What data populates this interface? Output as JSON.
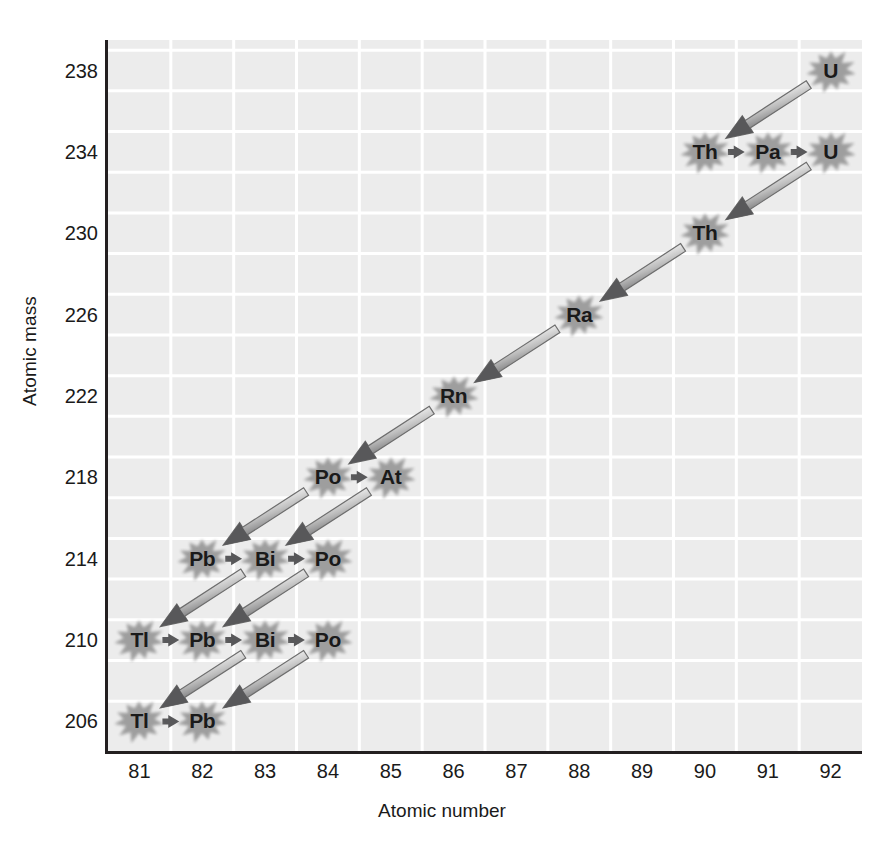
{
  "chart_data": {
    "type": "scatter",
    "title": "",
    "xlabel": "Atomic number",
    "ylabel": "Atomic mass",
    "xlim": [
      80.5,
      92.5
    ],
    "ylim": [
      204.5,
      239.5
    ],
    "xticks": [
      81,
      82,
      83,
      84,
      85,
      86,
      87,
      88,
      89,
      90,
      91,
      92
    ],
    "yticks": [
      238,
      234,
      230,
      226,
      222,
      218,
      214,
      210,
      206
    ],
    "grid": true,
    "legend": "none",
    "nodes": [
      {
        "symbol": "U",
        "atomic_number": 92,
        "atomic_mass": 238
      },
      {
        "symbol": "Th",
        "atomic_number": 90,
        "atomic_mass": 234
      },
      {
        "symbol": "Pa",
        "atomic_number": 91,
        "atomic_mass": 234
      },
      {
        "symbol": "U",
        "atomic_number": 92,
        "atomic_mass": 234
      },
      {
        "symbol": "Th",
        "atomic_number": 90,
        "atomic_mass": 230
      },
      {
        "symbol": "Ra",
        "atomic_number": 88,
        "atomic_mass": 226
      },
      {
        "symbol": "Rn",
        "atomic_number": 86,
        "atomic_mass": 222
      },
      {
        "symbol": "Po",
        "atomic_number": 84,
        "atomic_mass": 218
      },
      {
        "symbol": "At",
        "atomic_number": 85,
        "atomic_mass": 218
      },
      {
        "symbol": "Pb",
        "atomic_number": 82,
        "atomic_mass": 214
      },
      {
        "symbol": "Bi",
        "atomic_number": 83,
        "atomic_mass": 214
      },
      {
        "symbol": "Po",
        "atomic_number": 84,
        "atomic_mass": 214
      },
      {
        "symbol": "Tl",
        "atomic_number": 81,
        "atomic_mass": 210
      },
      {
        "symbol": "Pb",
        "atomic_number": 82,
        "atomic_mass": 210
      },
      {
        "symbol": "Bi",
        "atomic_number": 83,
        "atomic_mass": 210
      },
      {
        "symbol": "Po",
        "atomic_number": 84,
        "atomic_mass": 210
      },
      {
        "symbol": "Tl",
        "atomic_number": 81,
        "atomic_mass": 206
      },
      {
        "symbol": "Pb",
        "atomic_number": 82,
        "atomic_mass": 206
      }
    ],
    "transitions": [
      {
        "type": "alpha",
        "from": [
          92,
          238
        ],
        "to": [
          90,
          234
        ]
      },
      {
        "type": "beta",
        "from": [
          90,
          234
        ],
        "to": [
          91,
          234
        ]
      },
      {
        "type": "beta",
        "from": [
          91,
          234
        ],
        "to": [
          92,
          234
        ]
      },
      {
        "type": "alpha",
        "from": [
          92,
          234
        ],
        "to": [
          90,
          230
        ]
      },
      {
        "type": "alpha",
        "from": [
          90,
          230
        ],
        "to": [
          88,
          226
        ]
      },
      {
        "type": "alpha",
        "from": [
          88,
          226
        ],
        "to": [
          86,
          222
        ]
      },
      {
        "type": "alpha",
        "from": [
          86,
          222
        ],
        "to": [
          84,
          218
        ]
      },
      {
        "type": "beta",
        "from": [
          84,
          218
        ],
        "to": [
          85,
          218
        ]
      },
      {
        "type": "alpha",
        "from": [
          84,
          218
        ],
        "to": [
          82,
          214
        ]
      },
      {
        "type": "alpha",
        "from": [
          85,
          218
        ],
        "to": [
          83,
          214
        ]
      },
      {
        "type": "beta",
        "from": [
          82,
          214
        ],
        "to": [
          83,
          214
        ]
      },
      {
        "type": "beta",
        "from": [
          83,
          214
        ],
        "to": [
          84,
          214
        ]
      },
      {
        "type": "alpha",
        "from": [
          83,
          214
        ],
        "to": [
          81,
          210
        ]
      },
      {
        "type": "alpha",
        "from": [
          84,
          214
        ],
        "to": [
          82,
          210
        ]
      },
      {
        "type": "beta",
        "from": [
          81,
          210
        ],
        "to": [
          82,
          210
        ]
      },
      {
        "type": "beta",
        "from": [
          82,
          210
        ],
        "to": [
          83,
          210
        ]
      },
      {
        "type": "beta",
        "from": [
          83,
          210
        ],
        "to": [
          84,
          210
        ]
      },
      {
        "type": "alpha",
        "from": [
          83,
          210
        ],
        "to": [
          81,
          206
        ]
      },
      {
        "type": "alpha",
        "from": [
          84,
          210
        ],
        "to": [
          82,
          206
        ]
      },
      {
        "type": "beta",
        "from": [
          81,
          206
        ],
        "to": [
          82,
          206
        ]
      }
    ]
  },
  "colors": {
    "plot_background": "#ececec",
    "gridline": "#ffffff",
    "axis": "#231f20",
    "node_fill": "#9a9a9a",
    "node_text": "#1a1a1a",
    "arrow_dark": "#58585a",
    "arrow_light": "#fdfdfd",
    "tick_text": "#1a1a1a"
  },
  "axes": {
    "x_title": "Atomic number",
    "y_title": "Atomic mass"
  }
}
